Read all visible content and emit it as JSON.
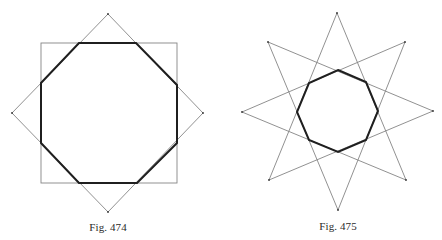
{
  "figures": [
    {
      "id": "fig-474",
      "caption": "Fig. 474",
      "description": "Regular octagon formed by the intersection of a square and the same square rotated 45 degrees",
      "center": [
        108,
        113
      ],
      "square": {
        "x": 41,
        "y": 43,
        "width": 136,
        "height": 140
      },
      "diamond": [
        [
          108,
          14
        ],
        [
          203,
          113
        ],
        [
          108,
          212
        ],
        [
          12,
          113
        ]
      ],
      "octagon": [
        [
          79,
          43
        ],
        [
          136,
          43
        ],
        [
          177,
          85
        ],
        [
          177,
          143
        ],
        [
          137,
          183
        ],
        [
          79,
          183
        ],
        [
          41,
          143
        ],
        [
          41,
          83
        ]
      ],
      "caption_pos": [
        108,
        228
      ]
    },
    {
      "id": "fig-475",
      "caption": "Fig. 475",
      "description": "Regular octagon formed at the center of an eight-pointed star polygon {8/3}",
      "center": [
        338,
        111
      ],
      "star_points": [
        [
          337,
          13
        ],
        [
          405,
          42
        ],
        [
          433,
          111
        ],
        [
          406,
          180
        ],
        [
          338,
          210
        ],
        [
          269,
          180
        ],
        [
          242,
          112
        ],
        [
          268,
          42
        ]
      ],
      "star_step": 3,
      "octagon": [
        [
          338,
          70
        ],
        [
          366,
          82
        ],
        [
          378,
          111
        ],
        [
          366,
          140
        ],
        [
          338,
          152
        ],
        [
          309,
          140
        ],
        [
          297,
          112
        ],
        [
          309,
          83
        ]
      ],
      "caption_pos": [
        338,
        227
      ]
    }
  ],
  "colors": {
    "thin_line": "#858585",
    "thick_line": "#1f1f1f",
    "background": "#ffffff",
    "caption": "#2a2a2a"
  }
}
